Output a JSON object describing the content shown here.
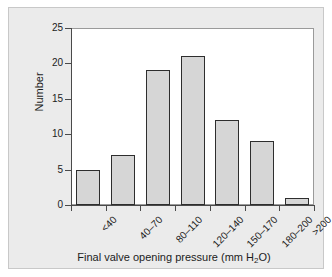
{
  "chart_data": {
    "type": "bar",
    "title": "",
    "subtitle": "",
    "xlabel": "Final valve opening pressure (mm H2O)",
    "xlabel_display": "Final valve opening pressure (mm H",
    "xlabel_sub": "2",
    "xlabel_tail": "O)",
    "ylabel": "Number",
    "categories": [
      "<40",
      "40–70",
      "80–110",
      "120–140",
      "150–170",
      "180–200",
      ">200"
    ],
    "values": [
      5,
      7,
      19,
      21,
      12,
      9,
      1
    ],
    "ylim": [
      0,
      25
    ],
    "ytick_values": [
      0,
      5,
      10,
      15,
      20,
      25
    ],
    "ytick_labels": [
      "0",
      "5",
      "10",
      "15",
      "20",
      "25"
    ],
    "grid": false,
    "legend": null,
    "legend_position": "none",
    "bar_fill_color": "#d6d6d6",
    "bar_edge_color": "#2e2e2e",
    "plot_background_color": "#ffffff",
    "panel_background_color": "#ebebeb",
    "axis_color": "#4a4a4a",
    "text_color": "#1c1c1c"
  }
}
